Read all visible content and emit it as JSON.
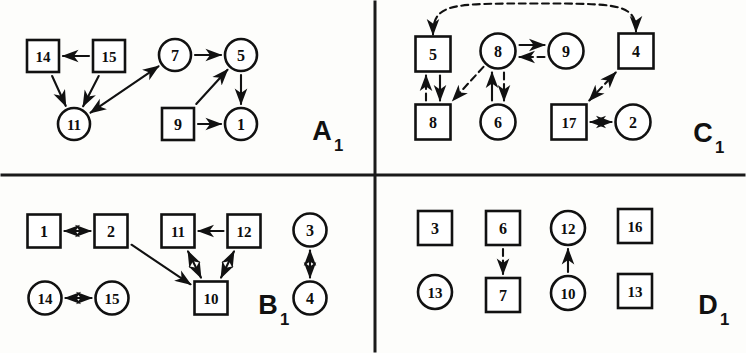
{
  "figure": {
    "width": 746,
    "height": 353,
    "background": "#fdfdfb",
    "ink_color": "#111111",
    "divider": {
      "vertical_x": 375,
      "horizontal_y": 175,
      "stroke_width": 3
    }
  },
  "panels": [
    {
      "id": "A1",
      "label": "A",
      "subscript": "1",
      "label_x": 322,
      "label_y": 131,
      "label_size": 27,
      "nodes": [
        {
          "id": "a-14",
          "text": "14",
          "shape": "square",
          "cx": 43,
          "cy": 56,
          "size": 32
        },
        {
          "id": "a-15",
          "text": "15",
          "shape": "square",
          "cx": 109,
          "cy": 56,
          "size": 32
        },
        {
          "id": "a-11",
          "text": "11",
          "shape": "circle",
          "cx": 74,
          "cy": 124,
          "size": 32
        },
        {
          "id": "a-7",
          "text": "7",
          "shape": "circle",
          "cx": 175,
          "cy": 55,
          "size": 32
        },
        {
          "id": "a-5",
          "text": "5",
          "shape": "circle",
          "cx": 241,
          "cy": 55,
          "size": 32
        },
        {
          "id": "a-9",
          "text": "9",
          "shape": "square",
          "cx": 178,
          "cy": 124,
          "size": 32
        },
        {
          "id": "a-1",
          "text": "1",
          "shape": "circle",
          "cx": 241,
          "cy": 124,
          "size": 32
        }
      ],
      "edges": [
        {
          "from": "a-15",
          "to": "a-14",
          "style": "solid",
          "arrows": "to"
        },
        {
          "from": "a-14",
          "to": "a-11",
          "style": "solid",
          "arrows": "to"
        },
        {
          "from": "a-15",
          "to": "a-11",
          "style": "solid",
          "arrows": "to"
        },
        {
          "from": "a-11",
          "to": "a-7",
          "style": "solid",
          "arrows": "both"
        },
        {
          "from": "a-7",
          "to": "a-5",
          "style": "solid",
          "arrows": "to"
        },
        {
          "from": "a-5",
          "to": "a-1",
          "style": "solid",
          "arrows": "to"
        },
        {
          "from": "a-9",
          "to": "a-1",
          "style": "solid",
          "arrows": "to"
        },
        {
          "from": "a-9",
          "to": "a-5",
          "style": "solid",
          "arrows": "to"
        }
      ]
    },
    {
      "id": "C1",
      "label": "C",
      "subscript": "1",
      "label_x": 703,
      "label_y": 133,
      "label_size": 27,
      "nodes": [
        {
          "id": "c-5",
          "text": "5",
          "shape": "square",
          "cx": 433,
          "cy": 54,
          "size": 35
        },
        {
          "id": "c-8t",
          "text": "8",
          "shape": "circle",
          "cx": 498,
          "cy": 51,
          "size": 35
        },
        {
          "id": "c-9",
          "text": "9",
          "shape": "circle",
          "cx": 566,
          "cy": 51,
          "size": 35
        },
        {
          "id": "c-4",
          "text": "4",
          "shape": "square",
          "cx": 636,
          "cy": 51,
          "size": 35
        },
        {
          "id": "c-8b",
          "text": "8",
          "shape": "square",
          "cx": 433,
          "cy": 122,
          "size": 35
        },
        {
          "id": "c-6",
          "text": "6",
          "shape": "circle",
          "cx": 498,
          "cy": 122,
          "size": 35
        },
        {
          "id": "c-17",
          "text": "17",
          "shape": "square",
          "cx": 569,
          "cy": 122,
          "size": 35
        },
        {
          "id": "c-2",
          "text": "2",
          "shape": "circle",
          "cx": 633,
          "cy": 122,
          "size": 35
        }
      ],
      "edges": [
        {
          "from": "c-5",
          "to": "c-4",
          "style": "dashed",
          "arrows": "both",
          "shape": "arc-top"
        },
        {
          "from": "c-8t",
          "to": "c-9",
          "style": "solid",
          "arrows": "to",
          "offset": -6
        },
        {
          "from": "c-9",
          "to": "c-8t",
          "style": "dashed",
          "arrows": "to",
          "offset": -6
        },
        {
          "from": "c-5",
          "to": "c-8b",
          "style": "solid",
          "arrows": "to",
          "offset": -7
        },
        {
          "from": "c-8b",
          "to": "c-5",
          "style": "dashed",
          "arrows": "to",
          "offset": -7
        },
        {
          "from": "c-8t",
          "to": "c-8b",
          "style": "dashed",
          "arrows": "to"
        },
        {
          "from": "c-6",
          "to": "c-8t",
          "style": "solid",
          "arrows": "to",
          "offset": -6
        },
        {
          "from": "c-8t",
          "to": "c-6",
          "style": "dashed",
          "arrows": "to",
          "offset": -6
        },
        {
          "from": "c-17",
          "to": "c-4",
          "style": "dashed",
          "arrows": "both"
        },
        {
          "from": "c-17",
          "to": "c-2",
          "style": "solid",
          "arrows": "both"
        }
      ]
    },
    {
      "id": "B1",
      "label": "B",
      "subscript": "1",
      "label_x": 268,
      "label_y": 305,
      "label_size": 27,
      "nodes": [
        {
          "id": "b-1",
          "text": "1",
          "shape": "square",
          "cx": 44,
          "cy": 231,
          "size": 33
        },
        {
          "id": "b-2",
          "text": "2",
          "shape": "square",
          "cx": 111,
          "cy": 231,
          "size": 33
        },
        {
          "id": "b-11",
          "text": "11",
          "shape": "square",
          "cx": 178,
          "cy": 231,
          "size": 33
        },
        {
          "id": "b-12",
          "text": "12",
          "shape": "square",
          "cx": 244,
          "cy": 231,
          "size": 33
        },
        {
          "id": "b-3",
          "text": "3",
          "shape": "circle",
          "cx": 310,
          "cy": 230,
          "size": 33
        },
        {
          "id": "b-14",
          "text": "14",
          "shape": "circle",
          "cx": 45,
          "cy": 298,
          "size": 33
        },
        {
          "id": "b-15",
          "text": "15",
          "shape": "circle",
          "cx": 112,
          "cy": 298,
          "size": 33
        },
        {
          "id": "b-10",
          "text": "10",
          "shape": "square",
          "cx": 211,
          "cy": 298,
          "size": 33
        },
        {
          "id": "b-4",
          "text": "4",
          "shape": "circle",
          "cx": 310,
          "cy": 298,
          "size": 33
        }
      ],
      "edges": [
        {
          "from": "b-1",
          "to": "b-2",
          "style": "solid",
          "arrows": "both"
        },
        {
          "from": "b-12",
          "to": "b-11",
          "style": "solid",
          "arrows": "to"
        },
        {
          "from": "b-11",
          "to": "b-10",
          "style": "solid",
          "arrows": "both"
        },
        {
          "from": "b-12",
          "to": "b-10",
          "style": "solid",
          "arrows": "both"
        },
        {
          "from": "b-2",
          "to": "b-10",
          "style": "solid",
          "arrows": "to"
        },
        {
          "from": "b-14",
          "to": "b-15",
          "style": "solid",
          "arrows": "both"
        },
        {
          "from": "b-3",
          "to": "b-4",
          "style": "solid",
          "arrows": "both"
        }
      ]
    },
    {
      "id": "D1",
      "label": "D",
      "subscript": "1",
      "label_x": 708,
      "label_y": 305,
      "label_size": 27,
      "nodes": [
        {
          "id": "d-3",
          "text": "3",
          "shape": "square",
          "cx": 435,
          "cy": 228,
          "size": 34
        },
        {
          "id": "d-6",
          "text": "6",
          "shape": "square",
          "cx": 503,
          "cy": 228,
          "size": 34
        },
        {
          "id": "d-12",
          "text": "12",
          "shape": "circle",
          "cx": 568,
          "cy": 228,
          "size": 34
        },
        {
          "id": "d-16",
          "text": "16",
          "shape": "square",
          "cx": 635,
          "cy": 226,
          "size": 34
        },
        {
          "id": "d-13c",
          "text": "13",
          "shape": "circle",
          "cx": 435,
          "cy": 292,
          "size": 34
        },
        {
          "id": "d-7",
          "text": "7",
          "shape": "square",
          "cx": 503,
          "cy": 295,
          "size": 34
        },
        {
          "id": "d-10",
          "text": "10",
          "shape": "circle",
          "cx": 568,
          "cy": 293,
          "size": 34
        },
        {
          "id": "d-13s",
          "text": "13",
          "shape": "square",
          "cx": 635,
          "cy": 291,
          "size": 34
        }
      ],
      "edges": [
        {
          "from": "d-6",
          "to": "d-7",
          "style": "dashed",
          "arrows": "to"
        },
        {
          "from": "d-10",
          "to": "d-12",
          "style": "solid",
          "arrows": "to"
        }
      ]
    }
  ]
}
